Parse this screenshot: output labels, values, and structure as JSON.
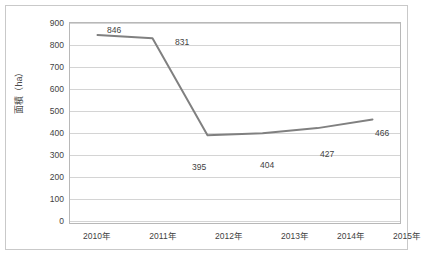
{
  "chart_data": {
    "type": "line",
    "title": "",
    "subtitle": "",
    "xlabel": "",
    "ylabel": "面積（ha）",
    "categories": [
      "2010年",
      "2011年",
      "2012年",
      "2013年",
      "2014年",
      "2015年"
    ],
    "values": [
      846,
      831,
      395,
      404,
      427,
      466
    ],
    "data_labels": [
      "846",
      "831",
      "395",
      "404",
      "427",
      "466"
    ],
    "ylim": [
      0,
      900
    ],
    "y_ticks": [
      900,
      800,
      700,
      600,
      500,
      400,
      300,
      200,
      100,
      0
    ],
    "y_tick_labels": [
      "900",
      "800",
      "700",
      "600",
      "500",
      "400",
      "300",
      "200",
      "100",
      "0"
    ],
    "grid": true,
    "legend": false,
    "legend_position": "none",
    "series": [
      {
        "name": "面積",
        "values": [
          846,
          831,
          395,
          404,
          427,
          466
        ],
        "color": "#808080",
        "line_width": 2,
        "markers": false
      }
    ],
    "colors": {
      "line": "#808080",
      "gridline": "#d4d4d4",
      "plot_border": "#b8b8b8",
      "frame_border": "#c9c9c9",
      "text": "#3f3f3f",
      "background": "#ffffff"
    }
  },
  "figure": {
    "caption": ""
  }
}
